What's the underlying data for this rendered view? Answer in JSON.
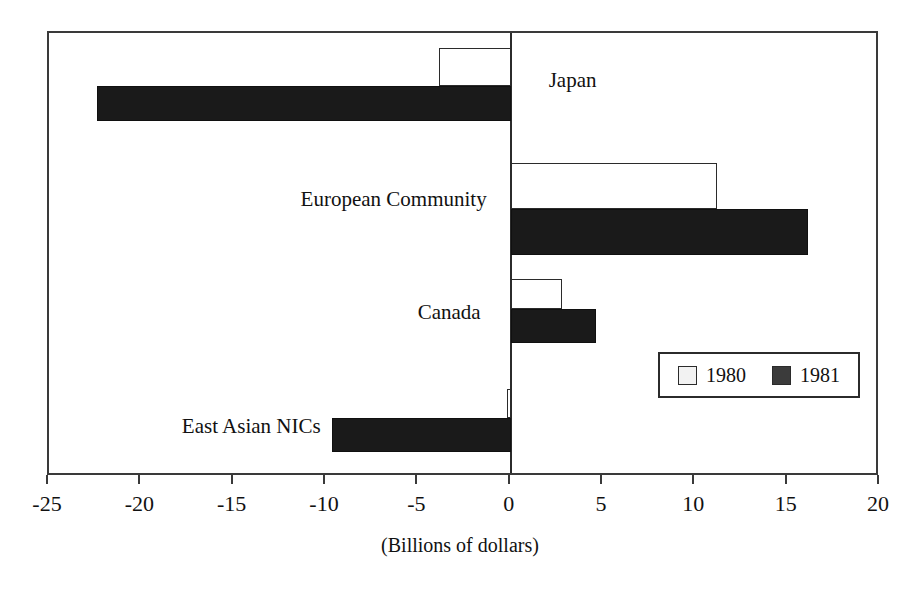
{
  "chart_data": {
    "type": "bar",
    "orientation": "horizontal",
    "title": "",
    "xlabel": "(Billions of dollars)",
    "ylabel": "",
    "xlim": [
      -25,
      20
    ],
    "xticks": [
      -25,
      -20,
      -15,
      -10,
      -5,
      0,
      5,
      10,
      15,
      20
    ],
    "xtick_labels": [
      "-25",
      "-20",
      "-15",
      "-10",
      "-5",
      "0",
      "5",
      "10",
      "15",
      "20"
    ],
    "grid": false,
    "categories": [
      "Japan",
      "European Community",
      "Canada",
      "East Asian NICs"
    ],
    "series": [
      {
        "name": "1980",
        "color": "#ffffff",
        "values": [
          -3.9,
          11.2,
          2.8,
          -0.2
        ]
      },
      {
        "name": "1981",
        "color": "#1a1a1a",
        "values": [
          -22.4,
          16.1,
          4.6,
          -9.7
        ]
      }
    ],
    "legend": {
      "position": "inside-right",
      "entries": [
        {
          "label": "1980",
          "swatch": "white"
        },
        {
          "label": "1981",
          "swatch": "black"
        }
      ]
    }
  },
  "axis": {
    "caption": "(Billions of dollars)"
  },
  "legend": {
    "entry_1980": "1980",
    "entry_1981": "1981"
  },
  "categories": {
    "japan": "Japan",
    "european_community": "European Community",
    "canada": "Canada",
    "east_asian_nics": "East Asian NICs"
  }
}
